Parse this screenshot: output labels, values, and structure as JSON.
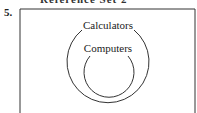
{
  "question": {
    "number": "5.",
    "cut_header": "Reference Set 2"
  },
  "diagram": {
    "outer_set": "Calculators",
    "inner_set": "Computers"
  }
}
